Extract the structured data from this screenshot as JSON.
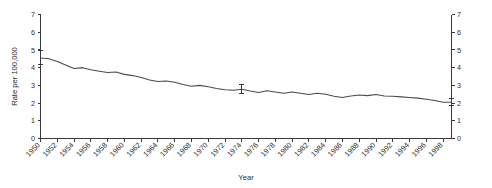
{
  "chart_data": {
    "type": "line",
    "title": "",
    "xlabel": "Year",
    "ylabel": "Rate per 100,000",
    "ylabel_right": "",
    "xlim": [
      1950,
      1999
    ],
    "ylim": [
      0,
      7
    ],
    "yticks": [
      0,
      1,
      2,
      3,
      4,
      5,
      6,
      7
    ],
    "ytick_labels": [
      "0",
      "1",
      "2",
      "3",
      "4",
      "5",
      "6",
      "7"
    ],
    "right_axis": true,
    "right_yticks": [
      0,
      1,
      2,
      3,
      4,
      5,
      6,
      7
    ],
    "right_ytick_labels": [
      "0",
      "1",
      "2",
      "3",
      "4",
      "5",
      "6",
      "7"
    ],
    "grid": false,
    "legend": "none",
    "xtick_labels": [
      "1950",
      "1952",
      "1954",
      "1956",
      "1958",
      "1960",
      "1962",
      "1964",
      "1966",
      "1968",
      "1970",
      "1972",
      "1974",
      "1976",
      "1978",
      "1980",
      "1982",
      "1984",
      "1986",
      "1988",
      "1990",
      "1992",
      "1994",
      "1996",
      "1998"
    ],
    "xtick_values": [
      1950,
      1952,
      1954,
      1956,
      1958,
      1960,
      1962,
      1964,
      1966,
      1968,
      1970,
      1972,
      1974,
      1976,
      1978,
      1980,
      1982,
      1984,
      1986,
      1988,
      1990,
      1992,
      1994,
      1996,
      1998
    ],
    "xtick_rotation": 45,
    "series": [
      {
        "name": "Rate per 100,000",
        "color": "#4a4a4a",
        "x": [
          1950,
          1951,
          1952,
          1953,
          1954,
          1955,
          1956,
          1957,
          1958,
          1959,
          1960,
          1961,
          1962,
          1963,
          1964,
          1965,
          1966,
          1967,
          1968,
          1969,
          1970,
          1971,
          1972,
          1973,
          1974,
          1975,
          1976,
          1977,
          1978,
          1979,
          1980,
          1981,
          1982,
          1983,
          1984,
          1985,
          1986,
          1987,
          1988,
          1989,
          1990,
          1991,
          1992,
          1993,
          1994,
          1995,
          1996,
          1997,
          1998,
          1999
        ],
        "values": [
          4.55,
          4.5,
          4.35,
          4.15,
          3.95,
          4.0,
          3.88,
          3.8,
          3.72,
          3.75,
          3.62,
          3.55,
          3.45,
          3.3,
          3.22,
          3.25,
          3.18,
          3.05,
          2.95,
          3.0,
          2.92,
          2.82,
          2.75,
          2.72,
          2.78,
          2.68,
          2.6,
          2.7,
          2.62,
          2.55,
          2.62,
          2.55,
          2.48,
          2.55,
          2.5,
          2.38,
          2.32,
          2.4,
          2.45,
          2.42,
          2.48,
          2.4,
          2.38,
          2.35,
          2.32,
          2.28,
          2.22,
          2.15,
          2.05,
          2.05
        ]
      }
    ],
    "error_bars": [
      {
        "x": 1950,
        "y": 4.55,
        "lower": 4.15,
        "upper": 4.95
      },
      {
        "x": 1974,
        "y": 2.78,
        "lower": 2.52,
        "upper": 3.05
      },
      {
        "x": 1999,
        "y": 2.05,
        "lower": 1.85,
        "upper": 2.28
      }
    ]
  }
}
